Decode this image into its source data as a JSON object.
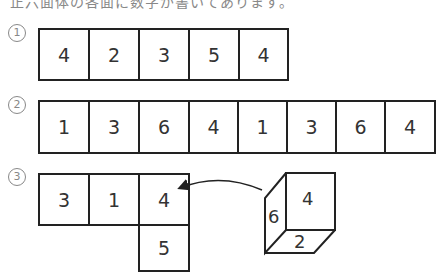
{
  "header": {
    "text": "正六面体の各面に数字が書いてあります。"
  },
  "problems": [
    {
      "label": "1",
      "cells": [
        "4",
        "2",
        "3",
        "5",
        "4"
      ]
    },
    {
      "label": "2",
      "cells": [
        "1",
        "3",
        "6",
        "4",
        "1",
        "3",
        "6",
        "4"
      ]
    },
    {
      "label": "3",
      "top_row": [
        "3",
        "1",
        "4"
      ],
      "below": "5",
      "cube": {
        "front": "4",
        "left": "6",
        "bottom": "2"
      }
    }
  ]
}
